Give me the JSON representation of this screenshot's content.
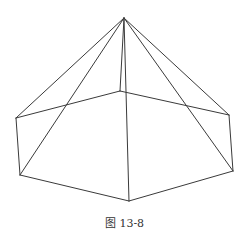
{
  "caption": "图 13-8",
  "diagram": {
    "type": "pyramid-wireframe",
    "stroke_color": "#3a3a3a",
    "background": "#ffffff",
    "vertices": {
      "apex": [
        124,
        18
      ],
      "back": [
        120,
        91
      ],
      "left_upper": [
        16,
        118
      ],
      "left_lower": [
        20,
        175
      ],
      "front": [
        129,
        201
      ],
      "right_lower": [
        233,
        171
      ],
      "right_upper": [
        229,
        115
      ]
    },
    "edges": [
      [
        "back",
        "left_upper"
      ],
      [
        "back",
        "right_upper"
      ],
      [
        "left_upper",
        "left_lower"
      ],
      [
        "left_lower",
        "front"
      ],
      [
        "front",
        "right_lower"
      ],
      [
        "right_lower",
        "right_upper"
      ],
      [
        "apex",
        "back"
      ],
      [
        "apex",
        "left_upper"
      ],
      [
        "apex",
        "left_lower"
      ],
      [
        "apex",
        "front"
      ],
      [
        "apex",
        "right_lower"
      ],
      [
        "apex",
        "right_upper"
      ]
    ]
  }
}
